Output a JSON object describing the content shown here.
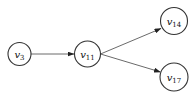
{
  "diagram": {
    "type": "directed-graph",
    "colors": {
      "stroke": "#333333",
      "edge": "#444444",
      "text": "#111111",
      "background": "#ffffff"
    },
    "nodes": [
      {
        "id": "v3",
        "base": "v",
        "sub": "3",
        "cx": 19.5,
        "cy": 54,
        "r": 11.5
      },
      {
        "id": "v11",
        "base": "v",
        "sub": "11",
        "cx": 87.5,
        "cy": 54,
        "r": 13
      },
      {
        "id": "v14",
        "base": "v",
        "sub": "14",
        "cx": 174,
        "cy": 21,
        "r": 13.5
      },
      {
        "id": "v17",
        "base": "v",
        "sub": "17",
        "cx": 174,
        "cy": 77,
        "r": 14
      }
    ],
    "edges": [
      {
        "from": "v3",
        "to": "v11"
      },
      {
        "from": "v11",
        "to": "v14"
      },
      {
        "from": "v11",
        "to": "v17"
      }
    ]
  }
}
